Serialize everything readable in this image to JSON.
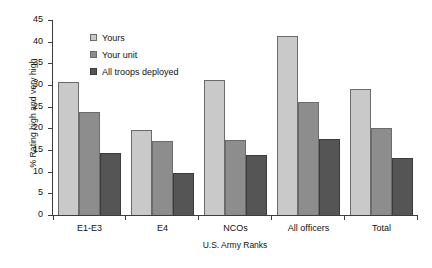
{
  "chart_data": {
    "type": "bar",
    "title": "",
    "xlabel": "U.S. Army Ranks",
    "ylabel": "% Rating high and very high",
    "categories": [
      "E1-E3",
      "E4",
      "NCOs",
      "All officers",
      "Total"
    ],
    "series": [
      {
        "name": "Yours",
        "color": "#c9c9c9",
        "values": [
          30.6,
          19.6,
          31.1,
          41.2,
          29.0
        ]
      },
      {
        "name": "Your unit",
        "color": "#8d8d8d",
        "values": [
          23.7,
          17.1,
          17.4,
          26.0,
          20.0
        ]
      },
      {
        "name": "All troops deployed",
        "color": "#555555",
        "values": [
          14.2,
          9.6,
          13.8,
          17.6,
          13.1
        ]
      }
    ],
    "ylim": [
      0,
      45
    ],
    "yticks": [
      0,
      5,
      10,
      15,
      20,
      25,
      30,
      35,
      40,
      45
    ],
    "ytick_labels": [
      "0",
      "5",
      "10",
      "15",
      "20",
      "25",
      "30",
      "35",
      "40",
      "45"
    ],
    "grid": false,
    "legend_position": "upper-left-inside"
  }
}
